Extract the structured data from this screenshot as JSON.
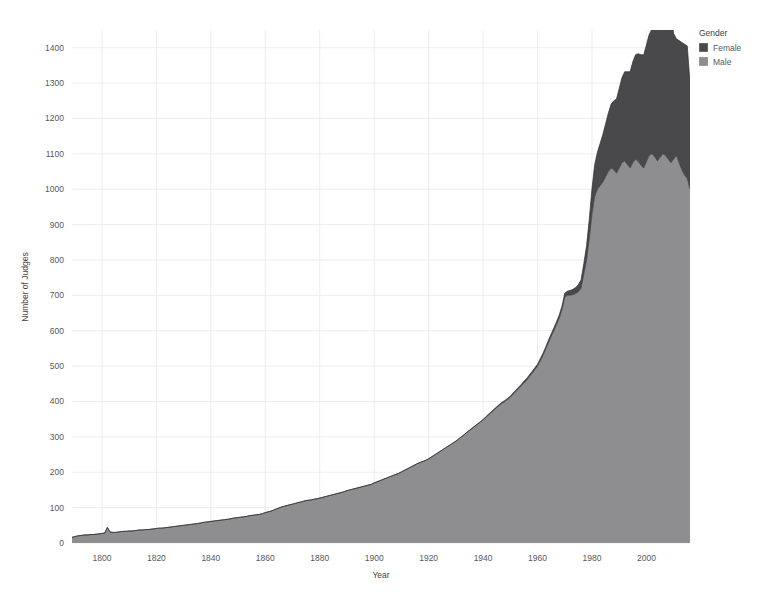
{
  "chart_data": {
    "type": "area",
    "stacked": true,
    "title": "",
    "xlabel": "Year",
    "ylabel": "Number of Judges",
    "xlim": [
      1789,
      2016
    ],
    "ylim": [
      0,
      1450
    ],
    "ytick_step": 100,
    "xtick_step": 20,
    "grid": true,
    "legend_title": "Gender",
    "legend_position": "top-right",
    "xticks": [
      1800,
      1820,
      1840,
      1860,
      1880,
      1900,
      1920,
      1940,
      1960,
      1980,
      2000
    ],
    "yticks": [
      0,
      100,
      200,
      300,
      400,
      500,
      600,
      700,
      800,
      900,
      1000,
      1100,
      1200,
      1300,
      1400
    ],
    "colors": {
      "female": "#4a4a4c",
      "male": "#8e8e91",
      "grid": "#e9e9ec",
      "text": "#58585a",
      "background": "#ffffff"
    },
    "x": [
      1789,
      1790,
      1791,
      1792,
      1793,
      1794,
      1795,
      1796,
      1797,
      1798,
      1799,
      1800,
      1801,
      1802,
      1803,
      1804,
      1805,
      1806,
      1807,
      1808,
      1809,
      1810,
      1811,
      1812,
      1813,
      1814,
      1815,
      1816,
      1817,
      1818,
      1819,
      1820,
      1821,
      1822,
      1823,
      1824,
      1825,
      1826,
      1827,
      1828,
      1829,
      1830,
      1831,
      1832,
      1833,
      1834,
      1835,
      1836,
      1837,
      1838,
      1839,
      1840,
      1841,
      1842,
      1843,
      1844,
      1845,
      1846,
      1847,
      1848,
      1849,
      1850,
      1851,
      1852,
      1853,
      1854,
      1855,
      1856,
      1857,
      1858,
      1859,
      1860,
      1861,
      1862,
      1863,
      1864,
      1865,
      1866,
      1867,
      1868,
      1869,
      1870,
      1871,
      1872,
      1873,
      1874,
      1875,
      1876,
      1877,
      1878,
      1879,
      1880,
      1881,
      1882,
      1883,
      1884,
      1885,
      1886,
      1887,
      1888,
      1889,
      1890,
      1891,
      1892,
      1893,
      1894,
      1895,
      1896,
      1897,
      1898,
      1899,
      1900,
      1901,
      1902,
      1903,
      1904,
      1905,
      1906,
      1907,
      1908,
      1909,
      1910,
      1911,
      1912,
      1913,
      1914,
      1915,
      1916,
      1917,
      1918,
      1919,
      1920,
      1921,
      1922,
      1923,
      1924,
      1925,
      1926,
      1927,
      1928,
      1929,
      1930,
      1931,
      1932,
      1933,
      1934,
      1935,
      1936,
      1937,
      1938,
      1939,
      1940,
      1941,
      1942,
      1943,
      1944,
      1945,
      1946,
      1947,
      1948,
      1949,
      1950,
      1951,
      1952,
      1953,
      1954,
      1955,
      1956,
      1957,
      1958,
      1959,
      1960,
      1961,
      1962,
      1963,
      1964,
      1965,
      1966,
      1967,
      1968,
      1969,
      1970,
      1971,
      1972,
      1973,
      1974,
      1975,
      1976,
      1977,
      1978,
      1979,
      1980,
      1981,
      1982,
      1983,
      1984,
      1985,
      1986,
      1987,
      1988,
      1989,
      1990,
      1991,
      1992,
      1993,
      1994,
      1995,
      1996,
      1997,
      1998,
      1999,
      2000,
      2001,
      2002,
      2003,
      2004,
      2005,
      2006,
      2007,
      2008,
      2009,
      2010,
      2011,
      2012,
      2013,
      2014,
      2015,
      2016
    ],
    "series": [
      {
        "name": "Male",
        "color": "#8e8e91",
        "values": [
          16,
          18,
          20,
          21,
          22,
          23,
          23,
          24,
          24,
          25,
          26,
          27,
          28,
          44,
          31,
          30,
          30,
          31,
          32,
          33,
          33,
          34,
          34,
          35,
          36,
          37,
          37,
          38,
          38,
          39,
          40,
          41,
          42,
          42,
          43,
          44,
          45,
          46,
          47,
          48,
          49,
          50,
          51,
          52,
          53,
          54,
          55,
          56,
          58,
          59,
          60,
          61,
          62,
          63,
          64,
          65,
          66,
          67,
          68,
          70,
          71,
          72,
          73,
          74,
          75,
          77,
          78,
          79,
          80,
          81,
          83,
          86,
          88,
          90,
          93,
          96,
          99,
          102,
          104,
          106,
          108,
          110,
          112,
          114,
          116,
          118,
          120,
          121,
          122,
          124,
          125,
          127,
          129,
          131,
          133,
          135,
          137,
          139,
          141,
          143,
          145,
          148,
          150,
          152,
          154,
          156,
          158,
          160,
          162,
          164,
          166,
          170,
          173,
          176,
          179,
          182,
          185,
          188,
          191,
          194,
          197,
          201,
          205,
          209,
          213,
          217,
          221,
          225,
          228,
          231,
          234,
          238,
          243,
          248,
          253,
          258,
          263,
          268,
          273,
          278,
          283,
          288,
          294,
          300,
          306,
          312,
          318,
          324,
          330,
          336,
          342,
          348,
          355,
          362,
          369,
          376,
          383,
          389,
          395,
          400,
          406,
          412,
          420,
          428,
          436,
          444,
          452,
          460,
          470,
          480,
          490,
          500,
          515,
          530,
          548,
          566,
          584,
          600,
          618,
          636,
          660,
          695,
          700,
          701,
          702,
          705,
          710,
          720,
          760,
          800,
          860,
          930,
          980,
          1000,
          1010,
          1020,
          1035,
          1050,
          1060,
          1055,
          1045,
          1060,
          1075,
          1080,
          1070,
          1060,
          1075,
          1085,
          1078,
          1068,
          1060,
          1078,
          1095,
          1100,
          1092,
          1080,
          1090,
          1100,
          1095,
          1085,
          1075,
          1085,
          1095,
          1075,
          1055,
          1040,
          1030,
          1000
        ]
      },
      {
        "name": "Female",
        "color": "#4a4a4c",
        "values": [
          0,
          0,
          0,
          0,
          0,
          0,
          0,
          0,
          0,
          0,
          0,
          0,
          0,
          0,
          0,
          0,
          0,
          0,
          0,
          0,
          0,
          0,
          0,
          0,
          0,
          0,
          0,
          0,
          0,
          0,
          0,
          0,
          0,
          0,
          0,
          0,
          0,
          0,
          0,
          0,
          0,
          0,
          0,
          0,
          0,
          0,
          0,
          0,
          0,
          0,
          0,
          0,
          0,
          0,
          0,
          0,
          0,
          0,
          0,
          0,
          0,
          0,
          0,
          0,
          0,
          0,
          0,
          0,
          0,
          0,
          0,
          0,
          0,
          0,
          0,
          0,
          0,
          0,
          0,
          0,
          0,
          0,
          0,
          0,
          0,
          0,
          0,
          0,
          0,
          0,
          0,
          0,
          0,
          0,
          0,
          0,
          0,
          0,
          0,
          0,
          0,
          0,
          0,
          0,
          0,
          0,
          0,
          0,
          0,
          0,
          0,
          0,
          0,
          0,
          0,
          0,
          0,
          0,
          0,
          0,
          0,
          0,
          0,
          0,
          0,
          0,
          0,
          0,
          0,
          0,
          0,
          0,
          0,
          0,
          0,
          0,
          0,
          0,
          0,
          0,
          0,
          0,
          0,
          0,
          0,
          1,
          1,
          1,
          1,
          1,
          1,
          1,
          2,
          2,
          2,
          2,
          2,
          3,
          3,
          3,
          3,
          3,
          4,
          4,
          4,
          4,
          5,
          5,
          5,
          5,
          5,
          5,
          6,
          6,
          6,
          7,
          7,
          8,
          8,
          9,
          10,
          11,
          12,
          13,
          15,
          17,
          20,
          24,
          30,
          40,
          55,
          72,
          90,
          105,
          120,
          135,
          150,
          165,
          180,
          195,
          210,
          225,
          240,
          252,
          262,
          272,
          285,
          295,
          305,
          312,
          320,
          330,
          342,
          352,
          360,
          368,
          378,
          390,
          398,
          405,
          412,
          355,
          330,
          345,
          360,
          370,
          375,
          300
        ]
      }
    ]
  },
  "legend": {
    "title": "Gender",
    "entries": [
      {
        "label": "Female",
        "color": "#4a4a4c"
      },
      {
        "label": "Male",
        "color": "#8e8e91"
      }
    ]
  },
  "axes": {
    "x_title": "Year",
    "y_title": "Number of Judges"
  }
}
